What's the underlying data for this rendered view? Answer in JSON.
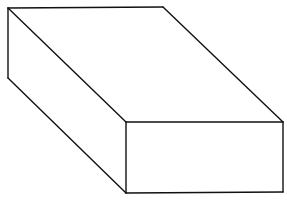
{
  "diagram": {
    "type": "oblique-projection-box",
    "background": "#ffffff",
    "stroke_color": "#111111",
    "stroke_width": 1.4,
    "vertices": {
      "top_back_left": [
        8,
        8
      ],
      "top_back_right": [
        163,
        7
      ],
      "top_front_right": [
        283,
        122
      ],
      "top_front_left": [
        126,
        122
      ],
      "bottom_back_left": [
        8,
        78
      ],
      "bottom_front_left": [
        126,
        193
      ],
      "bottom_front_right": [
        283,
        192
      ]
    },
    "edges": [
      {
        "name": "top-back-edge",
        "from": "top_back_left",
        "to": "top_back_right"
      },
      {
        "name": "top-right-edge",
        "from": "top_back_right",
        "to": "top_front_right"
      },
      {
        "name": "top-front-edge",
        "from": "top_front_right",
        "to": "top_front_left"
      },
      {
        "name": "top-left-edge",
        "from": "top_front_left",
        "to": "top_back_left"
      },
      {
        "name": "back-left-vertical-edge",
        "from": "top_back_left",
        "to": "bottom_back_left"
      },
      {
        "name": "bottom-left-edge",
        "from": "bottom_back_left",
        "to": "bottom_front_left"
      },
      {
        "name": "front-left-vertical-edge",
        "from": "top_front_left",
        "to": "bottom_front_left"
      },
      {
        "name": "front-bottom-edge",
        "from": "bottom_front_left",
        "to": "bottom_front_right"
      },
      {
        "name": "front-right-vertical-edge",
        "from": "top_front_right",
        "to": "bottom_front_right"
      }
    ],
    "faces": [
      {
        "name": "top-face",
        "points": [
          "top_back_left",
          "top_back_right",
          "top_front_right",
          "top_front_left"
        ]
      },
      {
        "name": "left-side-face",
        "points": [
          "top_back_left",
          "top_front_left",
          "bottom_front_left",
          "bottom_back_left"
        ]
      },
      {
        "name": "front-face",
        "points": [
          "top_front_left",
          "top_front_right",
          "bottom_front_right",
          "bottom_front_left"
        ]
      }
    ]
  }
}
